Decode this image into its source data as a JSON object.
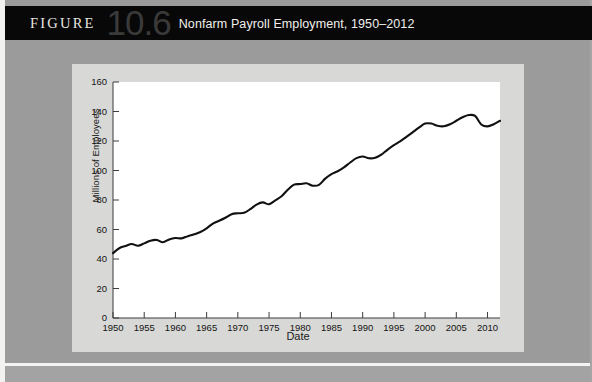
{
  "header": {
    "figure_word": "FIGURE",
    "figure_number": "10.6",
    "title": "Nonfarm Payroll Employment, 1950–2012"
  },
  "chart_data": {
    "type": "line",
    "title": "Nonfarm Payroll Employment, 1950–2012",
    "xlabel": "Date",
    "ylabel": "Millions of Employees",
    "xlim": [
      1950,
      2012
    ],
    "ylim": [
      0,
      160
    ],
    "ytick_labels": [
      "0",
      "20",
      "40",
      "60",
      "80",
      "100",
      "120",
      "140",
      "160"
    ],
    "ytick_values": [
      0,
      20,
      40,
      60,
      80,
      100,
      120,
      140,
      160
    ],
    "xtick_labels": [
      "1950",
      "1955",
      "1960",
      "1965",
      "1970",
      "1975",
      "1980",
      "1985",
      "1990",
      "1995",
      "2000",
      "2005",
      "2010"
    ],
    "xtick_values": [
      1950,
      1955,
      1960,
      1965,
      1970,
      1975,
      1980,
      1985,
      1990,
      1995,
      2000,
      2005,
      2010
    ],
    "grid": false,
    "legend": "none",
    "line_color": "#111111",
    "series": [
      {
        "name": "Nonfarm Payroll Employment",
        "x": [
          1950,
          1951,
          1952,
          1953,
          1954,
          1955,
          1956,
          1957,
          1958,
          1959,
          1960,
          1961,
          1962,
          1963,
          1964,
          1965,
          1966,
          1967,
          1968,
          1969,
          1970,
          1971,
          1972,
          1973,
          1974,
          1975,
          1976,
          1977,
          1978,
          1979,
          1980,
          1981,
          1982,
          1983,
          1984,
          1985,
          1986,
          1987,
          1988,
          1989,
          1990,
          1991,
          1992,
          1993,
          1994,
          1995,
          1996,
          1997,
          1998,
          1999,
          2000,
          2001,
          2002,
          2003,
          2004,
          2005,
          2006,
          2007,
          2008,
          2009,
          2010,
          2011,
          2012
        ],
        "values": [
          44.0,
          47.3,
          48.8,
          50.2,
          49.0,
          50.6,
          52.4,
          52.9,
          51.4,
          53.3,
          54.2,
          54.0,
          55.5,
          56.7,
          58.3,
          60.8,
          64.0,
          65.9,
          68.0,
          70.4,
          71.0,
          71.3,
          73.8,
          76.9,
          78.4,
          77.1,
          79.8,
          82.5,
          87.0,
          90.4,
          90.8,
          91.3,
          89.7,
          90.3,
          94.5,
          97.5,
          99.5,
          102.1,
          105.4,
          108.4,
          109.5,
          108.3,
          108.6,
          110.7,
          114.2,
          117.2,
          119.7,
          122.8,
          125.9,
          129.0,
          131.8,
          131.8,
          130.3,
          130.0,
          131.4,
          133.7,
          136.1,
          137.6,
          137.0,
          131.2,
          129.9,
          131.4,
          133.7
        ]
      }
    ]
  }
}
